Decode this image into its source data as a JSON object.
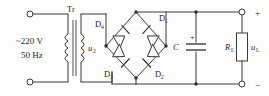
{
  "diagram": {
    "type": "circuit-schematic",
    "line_color": "#3a3a3a",
    "background_color": "#fdfdfc"
  },
  "source": {
    "voltage_label": "~220 V",
    "frequency_label": "50 Hz",
    "terminal_top": "input-terminal-top",
    "terminal_bottom": "input-terminal-bottom"
  },
  "transformer": {
    "label": "Tr",
    "secondary_voltage": "u",
    "secondary_voltage_sub": "2"
  },
  "bridge": {
    "diodes": [
      {
        "id": "D4",
        "label": "D",
        "sub": "4",
        "position": "top-left"
      },
      {
        "id": "D1",
        "label": "D",
        "sub": "1",
        "position": "top-right"
      },
      {
        "id": "D3",
        "label": "D",
        "sub": "3",
        "position": "bottom-left"
      },
      {
        "id": "D2",
        "label": "D",
        "sub": "2",
        "position": "bottom-right"
      }
    ]
  },
  "filter": {
    "capacitor_label": "C",
    "capacitor_polarity": "+"
  },
  "load": {
    "resistor_label": "R",
    "resistor_sub": "L",
    "voltage_label": "u",
    "voltage_sub": "L"
  },
  "output": {
    "positive_sign": "+",
    "negative_sign": "−"
  }
}
